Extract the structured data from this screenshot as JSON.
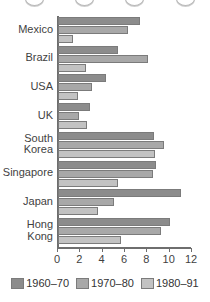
{
  "chart_data": {
    "type": "bar",
    "orientation": "horizontal",
    "title": "",
    "xlabel": "",
    "ylabel": "",
    "xlim": [
      0,
      12
    ],
    "xticks": [
      0,
      2,
      4,
      6,
      8,
      10,
      12
    ],
    "grid": false,
    "legend_position": "bottom",
    "categories": [
      "Mexico",
      "Brazil",
      "USA",
      "UK",
      "South\nKorea",
      "Singapore",
      "Japan",
      "Hong\nKong"
    ],
    "series": [
      {
        "name": "1960–70",
        "color": "#8c8c8c",
        "values": [
          7.3,
          5.4,
          4.3,
          2.9,
          8.6,
          8.8,
          11.0,
          10.0
        ]
      },
      {
        "name": "1970–80",
        "color": "#a8a8a8",
        "values": [
          6.3,
          8.1,
          3.0,
          1.9,
          9.5,
          8.5,
          5.0,
          9.2
        ]
      },
      {
        "name": "1980–91",
        "color": "#c2c2c2",
        "values": [
          1.3,
          2.5,
          1.8,
          2.6,
          8.7,
          5.4,
          3.6,
          5.6
        ]
      }
    ]
  },
  "legend": {
    "items": [
      {
        "label": "1960–70"
      },
      {
        "label": "1970–80"
      },
      {
        "label": "1980–91"
      }
    ]
  }
}
